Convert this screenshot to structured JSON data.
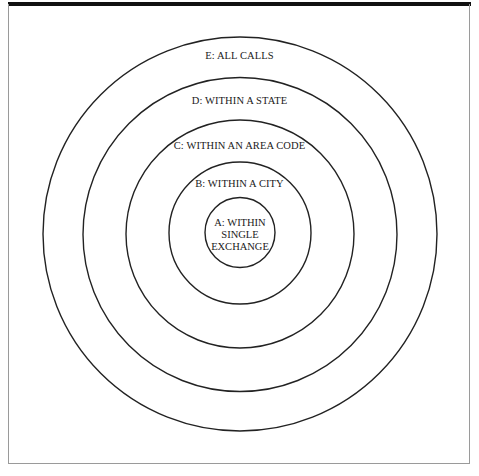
{
  "diagram": {
    "type": "concentric-circles",
    "center": {
      "x": 240,
      "y": 234
    },
    "stroke_color": "#222222",
    "rings": [
      {
        "id": "E",
        "label": "E: ALL CALLS",
        "radius": 197
      },
      {
        "id": "D",
        "label": "D: WITHIN A STATE",
        "radius": 157
      },
      {
        "id": "C",
        "label": "C: WITHIN AN AREA CODE",
        "radius": 114
      },
      {
        "id": "B",
        "label": "B: WITHIN A CITY",
        "radius": 71
      },
      {
        "id": "A",
        "label_lines": [
          "A: WITHIN",
          "SINGLE",
          "EXCHANGE"
        ],
        "radius": 35
      }
    ]
  }
}
